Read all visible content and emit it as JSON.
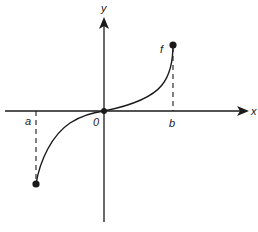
{
  "diagram": {
    "type": "function-graph",
    "axes": {
      "x_label": "x",
      "y_label": "y",
      "origin_label": "0"
    },
    "points": {
      "a_label": "a",
      "b_label": "b"
    },
    "curve": {
      "label": "f",
      "description": "Increasing curve through origin, concave down on left, concave up on right, with closed endpoints at x=a (below axis) and x=b (above axis)"
    },
    "colors": {
      "ink": "#1a1a1a",
      "background": "#ffffff"
    }
  }
}
